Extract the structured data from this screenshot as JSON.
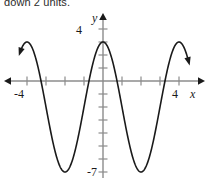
{
  "caption": {
    "text": "down 2 units."
  },
  "chart_data": {
    "type": "line",
    "title": "",
    "subtitle": "",
    "xlabel": "x",
    "ylabel": "y",
    "xlim": [
      -5.4,
      5.6
    ],
    "ylim": [
      -8.6,
      5.1
    ],
    "grid": false,
    "legend": null,
    "x_tick_labels": [
      {
        "value": -4,
        "label": "-4"
      },
      {
        "value": 4,
        "label": "4"
      }
    ],
    "y_tick_labels": [
      {
        "value": 4,
        "label": "4"
      },
      {
        "value": -7,
        "label": "-7"
      }
    ],
    "x_ticks": [
      -4,
      -3,
      -2,
      -1,
      1,
      2,
      3,
      4
    ],
    "y_ticks": [
      4,
      3,
      2,
      1,
      -1,
      -2,
      -3,
      -4,
      -5,
      -6,
      -7,
      -8
    ],
    "axes_arrows": [
      "left",
      "right",
      "up"
    ],
    "curve": {
      "name": "transformed cosine",
      "description": "cosine wave, amplitude 5, midline -2, period 4",
      "amplitude": 5,
      "midline": -2,
      "period": 4,
      "phase": 0,
      "maximum": 3,
      "minimum": -7,
      "x_start": -4.35,
      "x_end": 4.5,
      "endpoint_arrows": [
        "start",
        "end"
      ],
      "stroke": "#1a1a1a",
      "stroke_width": 1.6
    },
    "axis_color": "#8c8c8c",
    "tick_color": "#8c8c8c"
  }
}
